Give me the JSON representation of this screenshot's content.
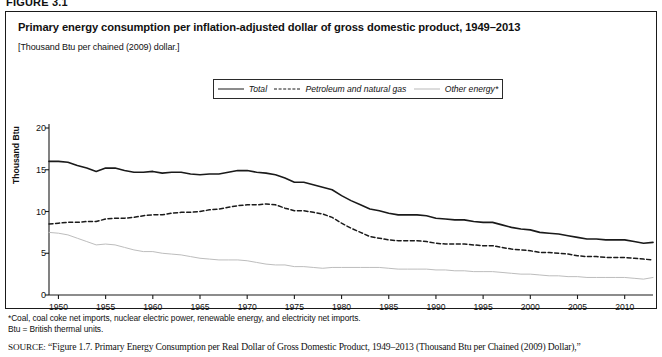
{
  "figure_header": "FIGURE 3.1",
  "figure": {
    "title": "Primary energy consumption per inflation-adjusted dollar of gross domestic product, 1949–2013",
    "units_note": "[Thousand Btu per chained (2009) dollar.]"
  },
  "footnotes": [
    "*Coal, coal coke net imports, nuclear electric power, renewable energy, and electricity net imports.",
    "Btu = British thermal units."
  ],
  "source": {
    "kicker": "SOURCE:",
    "text": " “Figure 1.7. Primary Energy Consumption per Real Dollar of Gross Domestic Product, 1949–2013 (Thousand Btu per Chained (2009) Dollar),”"
  },
  "colors": {
    "total": "#1a1a1a",
    "petroleum": "#1a1a1a",
    "other": "#bdbdbd",
    "axis": "#1a1a1a",
    "border": "#1a1a1a"
  },
  "chart_data": {
    "type": "line",
    "title": "Primary energy consumption per inflation-adjusted dollar of gross domestic product, 1949–2013",
    "subtitle": "[Thousand Btu per chained (2009) dollar.]",
    "xlabel": "",
    "ylabel": "Thousand Btu",
    "xlim": [
      1949,
      2013
    ],
    "ylim": [
      0,
      20
    ],
    "yticks": [
      0,
      5,
      10,
      15,
      20
    ],
    "xticks": [
      1950,
      1955,
      1960,
      1965,
      1970,
      1975,
      1980,
      1985,
      1990,
      1995,
      2000,
      2005,
      2010
    ],
    "grid": false,
    "legend_position": "top-center",
    "x": [
      1949,
      1950,
      1951,
      1952,
      1953,
      1954,
      1955,
      1956,
      1957,
      1958,
      1959,
      1960,
      1961,
      1962,
      1963,
      1964,
      1965,
      1966,
      1967,
      1968,
      1969,
      1970,
      1971,
      1972,
      1973,
      1974,
      1975,
      1976,
      1977,
      1978,
      1979,
      1980,
      1981,
      1982,
      1983,
      1984,
      1985,
      1986,
      1987,
      1988,
      1989,
      1990,
      1991,
      1992,
      1993,
      1994,
      1995,
      1996,
      1997,
      1998,
      1999,
      2000,
      2001,
      2002,
      2003,
      2004,
      2005,
      2006,
      2007,
      2008,
      2009,
      2010,
      2011,
      2012,
      2013
    ],
    "series": [
      {
        "name": "Total",
        "style": "solid",
        "color": "#1a1a1a",
        "values": [
          16.0,
          16.0,
          15.9,
          15.5,
          15.2,
          14.8,
          15.2,
          15.2,
          14.9,
          14.7,
          14.7,
          14.8,
          14.6,
          14.7,
          14.7,
          14.5,
          14.4,
          14.5,
          14.5,
          14.7,
          14.9,
          14.9,
          14.7,
          14.6,
          14.4,
          14.0,
          13.5,
          13.5,
          13.2,
          12.9,
          12.6,
          11.9,
          11.3,
          10.8,
          10.3,
          10.1,
          9.8,
          9.6,
          9.6,
          9.6,
          9.5,
          9.2,
          9.1,
          9.0,
          9.0,
          8.8,
          8.7,
          8.7,
          8.4,
          8.1,
          7.9,
          7.8,
          7.5,
          7.4,
          7.3,
          7.1,
          6.9,
          6.7,
          6.7,
          6.6,
          6.6,
          6.6,
          6.4,
          6.2,
          6.3
        ]
      },
      {
        "name": "Petroleum and natural gas",
        "style": "dashed",
        "color": "#1a1a1a",
        "values": [
          8.5,
          8.6,
          8.7,
          8.7,
          8.8,
          8.8,
          9.1,
          9.2,
          9.2,
          9.3,
          9.5,
          9.6,
          9.6,
          9.8,
          9.9,
          9.9,
          10.0,
          10.2,
          10.3,
          10.5,
          10.7,
          10.8,
          10.8,
          10.9,
          10.8,
          10.4,
          10.1,
          10.1,
          9.9,
          9.7,
          9.3,
          8.6,
          8.0,
          7.5,
          7.0,
          6.8,
          6.6,
          6.5,
          6.5,
          6.5,
          6.4,
          6.2,
          6.1,
          6.1,
          6.1,
          6.0,
          5.9,
          5.9,
          5.7,
          5.5,
          5.4,
          5.3,
          5.1,
          5.1,
          5.0,
          4.9,
          4.7,
          4.6,
          4.6,
          4.5,
          4.5,
          4.5,
          4.4,
          4.3,
          4.2
        ]
      },
      {
        "name": "Other energy*",
        "style": "solid-light",
        "color": "#bdbdbd",
        "values": [
          7.5,
          7.4,
          7.2,
          6.8,
          6.4,
          6.0,
          6.1,
          6.0,
          5.7,
          5.4,
          5.2,
          5.2,
          5.0,
          4.9,
          4.8,
          4.6,
          4.4,
          4.3,
          4.2,
          4.2,
          4.2,
          4.1,
          3.9,
          3.7,
          3.6,
          3.6,
          3.4,
          3.4,
          3.3,
          3.2,
          3.3,
          3.3,
          3.3,
          3.3,
          3.3,
          3.3,
          3.2,
          3.1,
          3.1,
          3.1,
          3.1,
          3.0,
          3.0,
          2.9,
          2.9,
          2.8,
          2.8,
          2.8,
          2.7,
          2.6,
          2.5,
          2.5,
          2.4,
          2.3,
          2.3,
          2.2,
          2.2,
          2.1,
          2.1,
          2.1,
          2.1,
          2.1,
          2.0,
          1.9,
          2.1
        ]
      }
    ],
    "legend": [
      {
        "label": "Total",
        "style": "solid"
      },
      {
        "label": "Petroleum and natural gas",
        "style": "dashed"
      },
      {
        "label": "Other energy*",
        "style": "solid-light"
      }
    ]
  }
}
